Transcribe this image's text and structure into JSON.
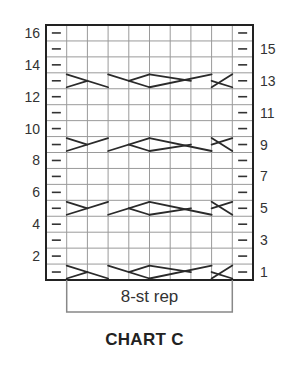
{
  "chart": {
    "title": "CHART C",
    "repeat_label": "8-st rep",
    "columns": 10,
    "rows": 16,
    "left_row_numbers": [
      "16",
      "14",
      "12",
      "10",
      "8",
      "6",
      "4",
      "2"
    ],
    "right_row_numbers": [
      "15",
      "13",
      "11",
      "9",
      "7",
      "5",
      "3",
      "1"
    ],
    "edge_symbol": "–",
    "edge_symbol_meaning": "purl",
    "cable_rows": [
      1,
      5,
      9,
      13
    ],
    "colors": {
      "grid_line": "#9a9a9a",
      "border": "#222222",
      "cable_line": "#2a2a2a",
      "repeat_box": "#888888",
      "text": "#333333"
    }
  }
}
